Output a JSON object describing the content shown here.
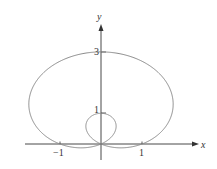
{
  "chart_data": {
    "type": "line",
    "title": "",
    "equation": "r = 1 + 2 sin θ",
    "curve": "polar limaçon with inner loop",
    "xlabel": "x",
    "ylabel": "y",
    "x_ticks": [
      -1,
      1
    ],
    "x_tick_labels": [
      "−1",
      "1"
    ],
    "y_ticks": [
      1,
      3
    ],
    "y_tick_labels": [
      "1",
      "3"
    ],
    "xlim": [
      -1.9,
      2.4
    ],
    "ylim": [
      -0.4,
      3.9
    ],
    "grid": false,
    "legend": null,
    "key_points": [
      {
        "x": 0,
        "y": 3
      },
      {
        "x": 0,
        "y": 1
      },
      {
        "x": 1,
        "y": 0
      },
      {
        "x": -1,
        "y": 0
      },
      {
        "x": 0,
        "y": 0
      }
    ],
    "curve_color": "#8a8a8a",
    "axis_color": "#333333"
  }
}
